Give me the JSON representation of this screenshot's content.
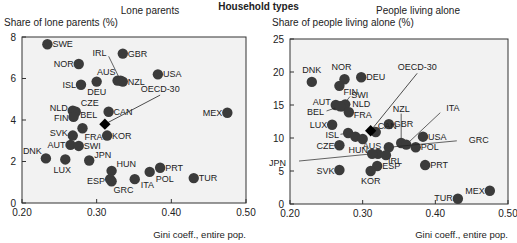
{
  "title": "Household types",
  "chart_data": [
    {
      "type": "scatter",
      "title": "Lone parents",
      "ylabel": "Share of lone parents (%)",
      "xlabel": "Gini coeff., entire pop.",
      "xlim": [
        0.2,
        0.5
      ],
      "ylim": [
        0,
        8
      ],
      "xticks": [
        "0.20",
        "0.30",
        "0.40",
        "0.50"
      ],
      "yticks": [
        "0",
        "2",
        "4",
        "6",
        "8"
      ],
      "grid": false,
      "points": [
        {
          "label": "SWE",
          "x": 0.234,
          "y": 7.65,
          "lx": 5,
          "ly": 3,
          "anchor": "start"
        },
        {
          "label": "GBR",
          "x": 0.335,
          "y": 7.2,
          "lx": 5,
          "ly": 3,
          "anchor": "start"
        },
        {
          "label": "NOR",
          "x": 0.276,
          "y": 6.7,
          "lx": -5,
          "ly": 3,
          "anchor": "end"
        },
        {
          "label": "USA",
          "x": 0.382,
          "y": 6.2,
          "lx": 5,
          "ly": 3,
          "anchor": "start"
        },
        {
          "label": "AUS",
          "x": 0.328,
          "y": 5.9,
          "lx": -2,
          "ly": -6,
          "anchor": "end"
        },
        {
          "label": "NZL",
          "x": 0.335,
          "y": 5.85,
          "lx": 5,
          "ly": 3,
          "anchor": "start"
        },
        {
          "label": "IRL",
          "x": 0.332,
          "y": 5.9,
          "lx": -14,
          "ly": -25,
          "anchor": "end",
          "leader": true
        },
        {
          "label": "ISL",
          "x": 0.279,
          "y": 5.7,
          "lx": -5,
          "ly": 3,
          "anchor": "end"
        },
        {
          "label": "DEU",
          "x": 0.3,
          "y": 5.85,
          "lx": 0,
          "ly": 13,
          "anchor": "middle"
        },
        {
          "label": "MEX",
          "x": 0.475,
          "y": 4.35,
          "lx": -5,
          "ly": 3,
          "anchor": "end"
        },
        {
          "label": "NLD",
          "x": 0.268,
          "y": 4.45,
          "lx": -5,
          "ly": 0,
          "anchor": "end"
        },
        {
          "label": "CZE",
          "x": 0.272,
          "y": 4.4,
          "lx": 5,
          "ly": -6,
          "anchor": "start"
        },
        {
          "label": "BEL",
          "x": 0.27,
          "y": 4.3,
          "lx": 6,
          "ly": 4,
          "anchor": "start"
        },
        {
          "label": "FIN",
          "x": 0.269,
          "y": 4.15,
          "lx": -5,
          "ly": 4,
          "anchor": "end"
        },
        {
          "label": "CAN",
          "x": 0.316,
          "y": 4.4,
          "lx": 5,
          "ly": 3,
          "anchor": "start"
        },
        {
          "label": "FRA",
          "x": 0.281,
          "y": 3.6,
          "lx": 2,
          "ly": 12,
          "anchor": "start"
        },
        {
          "label": "SVK",
          "x": 0.268,
          "y": 3.25,
          "lx": -5,
          "ly": 0,
          "anchor": "end"
        },
        {
          "label": "KOR",
          "x": 0.314,
          "y": 3.25,
          "lx": 5,
          "ly": 3,
          "anchor": "start"
        },
        {
          "label": "AUT",
          "x": 0.265,
          "y": 2.8,
          "lx": -5,
          "ly": 3,
          "anchor": "end"
        },
        {
          "label": "SWI",
          "x": 0.276,
          "y": 2.75,
          "lx": 5,
          "ly": 3,
          "anchor": "start"
        },
        {
          "label": "DNK",
          "x": 0.232,
          "y": 2.15,
          "lx": -4,
          "ly": -4,
          "anchor": "end"
        },
        {
          "label": "LUX",
          "x": 0.258,
          "y": 2.1,
          "lx": -3,
          "ly": 14,
          "anchor": "middle"
        },
        {
          "label": "JPN",
          "x": 0.29,
          "y": 2.05,
          "lx": 5,
          "ly": -2,
          "anchor": "start"
        },
        {
          "label": "HUN",
          "x": 0.32,
          "y": 1.55,
          "lx": 5,
          "ly": -4,
          "anchor": "start"
        },
        {
          "label": "PRT",
          "x": 0.385,
          "y": 1.7,
          "lx": 5,
          "ly": 3,
          "anchor": "start"
        },
        {
          "label": "POL",
          "x": 0.371,
          "y": 1.5,
          "lx": 6,
          "ly": 10,
          "anchor": "start"
        },
        {
          "label": "ESP",
          "x": 0.318,
          "y": 1.15,
          "lx": -5,
          "ly": 5,
          "anchor": "end"
        },
        {
          "label": "GRC",
          "x": 0.32,
          "y": 1.05,
          "lx": 2,
          "ly": 12,
          "anchor": "start"
        },
        {
          "label": "ITA",
          "x": 0.351,
          "y": 1.15,
          "lx": 6,
          "ly": 9,
          "anchor": "start"
        },
        {
          "label": "TUR",
          "x": 0.43,
          "y": 1.2,
          "lx": 5,
          "ly": 3,
          "anchor": "start"
        }
      ],
      "highlight": {
        "label": "OECD-30",
        "x": 0.311,
        "y": 3.8,
        "label_x": 0.385,
        "label_y": 5.2
      }
    },
    {
      "type": "scatter",
      "title": "People living alone",
      "ylabel": "Share of people living alone (%)",
      "xlabel": "Gini coeff., entire pop.",
      "xlim": [
        0.2,
        0.5
      ],
      "ylim": [
        0,
        25
      ],
      "xticks": [
        "0.20",
        "0.30",
        "0.40",
        "0.50"
      ],
      "yticks": [
        "0",
        "5",
        "10",
        "15",
        "20",
        "25"
      ],
      "grid": false,
      "points": [
        {
          "label": "DNK",
          "x": 0.23,
          "y": 18.5,
          "lx": 0,
          "ly": -9,
          "anchor": "middle"
        },
        {
          "label": "NOR",
          "x": 0.275,
          "y": 18.9,
          "lx": -3,
          "ly": -9,
          "anchor": "middle"
        },
        {
          "label": "DEU",
          "x": 0.298,
          "y": 19.2,
          "lx": 5,
          "ly": 3,
          "anchor": "start"
        },
        {
          "label": "FIN",
          "x": 0.268,
          "y": 17.9,
          "lx": 4,
          "ly": 9,
          "anchor": "start"
        },
        {
          "label": "AUT",
          "x": 0.263,
          "y": 15.0,
          "lx": -5,
          "ly": 0,
          "anchor": "end"
        },
        {
          "label": "SWI",
          "x": 0.272,
          "y": 14.8,
          "lx": 9,
          "ly": -8,
          "anchor": "start",
          "leader": true
        },
        {
          "label": "NLD",
          "x": 0.276,
          "y": 15.1,
          "lx": 7,
          "ly": 3,
          "anchor": "start"
        },
        {
          "label": "BEL",
          "x": 0.269,
          "y": 14.8,
          "lx": -16,
          "ly": 9,
          "anchor": "end",
          "leader": true
        },
        {
          "label": "FRA",
          "x": 0.281,
          "y": 13.9,
          "lx": 5,
          "ly": 6,
          "anchor": "start"
        },
        {
          "label": "LUX",
          "x": 0.258,
          "y": 12.0,
          "lx": -5,
          "ly": 3,
          "anchor": "end"
        },
        {
          "label": "GBR",
          "x": 0.336,
          "y": 12.1,
          "lx": 5,
          "ly": 3,
          "anchor": "start"
        },
        {
          "label": "CAN",
          "x": 0.318,
          "y": 10.9,
          "lx": 2,
          "ly": -3,
          "anchor": "start"
        },
        {
          "label": "ISL",
          "x": 0.28,
          "y": 10.75,
          "lx": -9,
          "ly": 5,
          "anchor": "end",
          "leader": true
        },
        {
          "label": "",
          "x": 0.29,
          "y": 10.2,
          "lx": 0,
          "ly": 0,
          "anchor": "start"
        },
        {
          "label": "AUS",
          "x": 0.3,
          "y": 9.85,
          "lx": 0,
          "ly": 10,
          "anchor": "start"
        },
        {
          "label": "CZE",
          "x": 0.268,
          "y": 8.9,
          "lx": -5,
          "ly": 4,
          "anchor": "end"
        },
        {
          "label": "USA",
          "x": 0.383,
          "y": 10.2,
          "lx": 5,
          "ly": 3,
          "anchor": "start"
        },
        {
          "label": "NZL",
          "x": 0.353,
          "y": 9.25,
          "lx": 0,
          "ly": -31,
          "anchor": "middle",
          "leader": true
        },
        {
          "label": "ITA",
          "x": 0.36,
          "y": 9.0,
          "lx": 40,
          "ly": -34,
          "anchor": "start",
          "leader": true
        },
        {
          "label": "POL",
          "x": 0.373,
          "y": 8.6,
          "lx": 5,
          "ly": 3,
          "anchor": "start"
        },
        {
          "label": "GRC",
          "x": 0.336,
          "y": 8.6,
          "lx": 80,
          "ly": -4,
          "anchor": "start",
          "leader": true
        },
        {
          "label": "HUN",
          "x": 0.321,
          "y": 7.6,
          "lx": -10,
          "ly": -1,
          "anchor": "end"
        },
        {
          "label": "IRL",
          "x": 0.332,
          "y": 7.4,
          "lx": 2,
          "ly": 9,
          "anchor": "start"
        },
        {
          "label": "JPN",
          "x": 0.313,
          "y": 7.6,
          "lx": -86,
          "ly": 12,
          "anchor": "end",
          "leader": true
        },
        {
          "label": "PRT",
          "x": 0.386,
          "y": 5.9,
          "lx": 5,
          "ly": 3,
          "anchor": "start"
        },
        {
          "label": "ESP",
          "x": 0.32,
          "y": 5.75,
          "lx": 5,
          "ly": 3,
          "anchor": "start"
        },
        {
          "label": "SVK",
          "x": 0.268,
          "y": 5.15,
          "lx": -5,
          "ly": 4,
          "anchor": "end"
        },
        {
          "label": "KOR",
          "x": 0.311,
          "y": 5.0,
          "lx": 0,
          "ly": 13,
          "anchor": "middle"
        },
        {
          "label": "MEX",
          "x": 0.475,
          "y": 2.0,
          "lx": -5,
          "ly": 3,
          "anchor": "end"
        },
        {
          "label": "TUR",
          "x": 0.431,
          "y": 0.8,
          "lx": -5,
          "ly": 2,
          "anchor": "end"
        }
      ],
      "highlight": {
        "label": "OECD-30",
        "x": 0.311,
        "y": 11.1,
        "label_x": 0.375,
        "label_y": 19.8
      }
    }
  ],
  "colors": {
    "dot": "#3b3b3b",
    "diamond": "#000000",
    "plot_bg": "#f2f2f2",
    "axis": "#333333",
    "text": "#222222"
  }
}
